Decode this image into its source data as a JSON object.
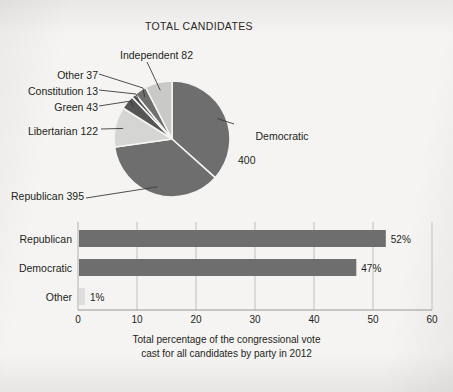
{
  "figure": {
    "background_color": "#f5f4f2",
    "dark_fill": "#6e6e6e",
    "light_fill": "#d5d5d3",
    "gridline_color": "#b9b9b7",
    "axis_color": "#8d8d8b",
    "text_color": "#231f20"
  },
  "pie": {
    "title": "TOTAL CANDIDATES",
    "center": {
      "x": 172,
      "y": 139
    },
    "radius": 58,
    "labels": {
      "democratic": {
        "name": "Democratic",
        "value": "400"
      },
      "republican": "Republican 395",
      "libertarian": "Libertarian 122",
      "green": "Green 43",
      "constitution": "Constitution 13",
      "other": "Other 37",
      "independent": "Independent 82"
    }
  },
  "bar": {
    "caption_line1": "Total percentage of the congressional vote",
    "caption_line2": "cast for all candidates by party in 2012",
    "categories": [
      "Republican",
      "Democratic",
      "Other"
    ],
    "value_labels": [
      "52%",
      "47%",
      "1%"
    ],
    "tick_labels": [
      "0",
      "10",
      "20",
      "30",
      "40",
      "50",
      "60"
    ]
  },
  "chart_data": [
    {
      "type": "pie",
      "title": "TOTAL CANDIDATES",
      "unit": "candidates",
      "total": 1092,
      "categories": [
        "Democratic",
        "Republican",
        "Libertarian",
        "Green",
        "Constitution",
        "Other",
        "Independent"
      ],
      "values": [
        400,
        395,
        122,
        43,
        13,
        37,
        82
      ],
      "labels": [
        "Democratic 400",
        "Republican 395",
        "Libertarian 122",
        "Green 43",
        "Constitution 13",
        "Other 37",
        "Independent 82"
      ],
      "slice_colors": [
        "#6e6e6e",
        "#6e6e6e",
        "#d5d5d3",
        "#555555",
        "#555555",
        "#6e6e6e",
        "#c9c9c7"
      ],
      "start_angle_deg": 0,
      "direction": "clockwise",
      "legend": "leader-line labels",
      "grid": false
    },
    {
      "type": "bar",
      "orientation": "horizontal",
      "title": "",
      "subtitle": "Total percentage of the congressional vote cast for all candidates by party in 2012",
      "categories": [
        "Republican",
        "Democratic",
        "Other"
      ],
      "values": [
        52,
        47,
        1
      ],
      "data_labels": [
        "52%",
        "47%",
        "1%"
      ],
      "xlabel": "",
      "ylabel": "",
      "xlim": [
        0,
        60
      ],
      "xticks": [
        0,
        10,
        20,
        30,
        40,
        50,
        60
      ],
      "bar_colors": [
        "#6e6e6e",
        "#6e6e6e",
        "#dedede"
      ],
      "grid": true,
      "grid_axis": "x",
      "legend": "none"
    }
  ]
}
